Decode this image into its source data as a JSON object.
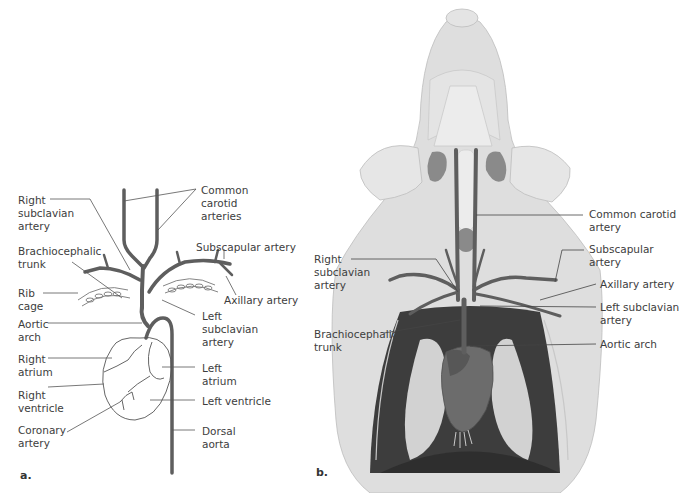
{
  "panel_a": {
    "letter": "a.",
    "labels": {
      "right_subclavian": "Right\nsubclavian\nartery",
      "brachiocephalic": "Brachiocephalic\ntrunk",
      "rib_cage": "Rib\ncage",
      "aortic_arch": "Aortic\narch",
      "right_atrium": "Right\natrium",
      "right_ventricle": "Right\nventricle",
      "coronary": "Coronary\nartery",
      "common_carotid": "Common\ncarotid\narteries",
      "subscapular": "Subscapular artery",
      "axillary": "Axillary artery",
      "left_subclavian": "Left\nsubclavian\nartery",
      "left_atrium": "Left\natrium",
      "left_ventricle": "Left ventricle",
      "dorsal_aorta": "Dorsal\naorta"
    }
  },
  "panel_b": {
    "letter": "b.",
    "labels": {
      "common_carotid": "Common carotid\nartery",
      "subscapular": "Subscapular\nartery",
      "axillary": "Axillary artery",
      "left_subclavian": "Left subclavian\nartery",
      "aortic_arch": "Aortic arch",
      "right_subclavian": "Right\nsubclavian\nartery",
      "brachiocephalic": "Brachiocephalic\ntrunk"
    }
  },
  "colors": {
    "vessel": "#5e5e5e",
    "skin": "#dedede",
    "skin_light": "#ebebeb",
    "cavity": "#3d3d3d",
    "heart": "#6c6c6c",
    "lung": "#d2d2d2",
    "gland": "#8a8a8a"
  }
}
